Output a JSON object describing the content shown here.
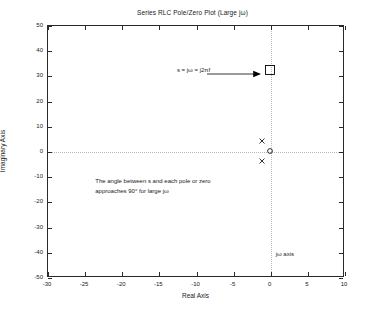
{
  "chart_data": {
    "type": "scatter",
    "title": "Series RLC Pole/Zero Plot (Large jω)",
    "xlabel": "Real Axis",
    "ylabel": "Imaginary Axis",
    "xlim": [
      -30,
      10
    ],
    "ylim": [
      -50,
      50
    ],
    "xticks": [
      -30,
      -25,
      -20,
      -15,
      -10,
      -5,
      0,
      5,
      10
    ],
    "xticklabels": [
      "-30",
      "-25",
      "-20",
      "-15",
      "-10",
      "-5",
      "0",
      "5",
      "10"
    ],
    "yticks": [
      -50,
      -40,
      -30,
      -20,
      -10,
      0,
      10,
      20,
      30,
      40,
      50
    ],
    "yticklabels": [
      "-50",
      "-40",
      "-30",
      "-20",
      "-10",
      "0",
      "10",
      "20",
      "30",
      "40",
      "50"
    ],
    "grid": "dotted-zero-axes-only",
    "legend": "none",
    "series": [
      {
        "name": "poles",
        "marker": "x",
        "points": [
          {
            "x": -1,
            "y": 4
          },
          {
            "x": -1,
            "y": -4
          }
        ]
      },
      {
        "name": "zero",
        "marker": "o",
        "points": [
          {
            "x": 0,
            "y": 0
          }
        ]
      },
      {
        "name": "s test point",
        "marker": "square",
        "points": [
          {
            "x": 0,
            "y": 32
          }
        ]
      }
    ],
    "annotations": [
      {
        "name": "s-definition",
        "text": "s = jω = j2πf",
        "x": -12.5,
        "y": 32,
        "arrow": {
          "from_x": -8.5,
          "to_x": -1.2,
          "y": 32
        }
      },
      {
        "name": "angle-note-line1",
        "text": "The angle between s and each pole or zero",
        "x": -23.5,
        "y": -12
      },
      {
        "name": "angle-note-line2",
        "text": "approaches 90° for large jω",
        "x": -23.5,
        "y": -16
      },
      {
        "name": "jomega-axis-label",
        "text": "jω axis",
        "x": 0.8,
        "y": -41
      }
    ],
    "colors": {
      "axis": "#2a2a2a",
      "grid": "#b9b9b9",
      "marker": "#000000",
      "background": "#ffffff"
    }
  }
}
